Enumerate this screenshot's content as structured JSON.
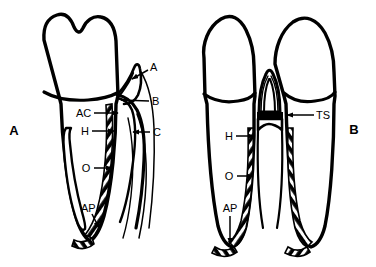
{
  "figure": {
    "title": "",
    "background_color": "#ffffff",
    "ink_color": "#000000"
  },
  "panels": [
    {
      "id": "panel-a",
      "letter": "A",
      "description": "single tooth in sagittal section with periodontium",
      "labels": [
        {
          "key": "A",
          "text": "A",
          "arrow": "down-left"
        },
        {
          "key": "B",
          "text": "B",
          "arrow": "left"
        },
        {
          "key": "AC",
          "text": "AC",
          "arrow": "right"
        },
        {
          "key": "H",
          "text": "H",
          "arrow": "right"
        },
        {
          "key": "C",
          "text": "C",
          "arrow": "left"
        },
        {
          "key": "O",
          "text": "O",
          "arrow": "right"
        },
        {
          "key": "AP",
          "text": "AP",
          "arrow": "down-right"
        }
      ]
    },
    {
      "id": "panel-b",
      "letter": "B",
      "description": "two adjacent teeth with interdental septum",
      "labels": [
        {
          "key": "TS",
          "text": "TS",
          "arrow": "left"
        },
        {
          "key": "H",
          "text": "H",
          "arrow": "right"
        },
        {
          "key": "O",
          "text": "O",
          "arrow": "right"
        },
        {
          "key": "AP",
          "text": "AP",
          "arrow": "down"
        }
      ]
    }
  ]
}
